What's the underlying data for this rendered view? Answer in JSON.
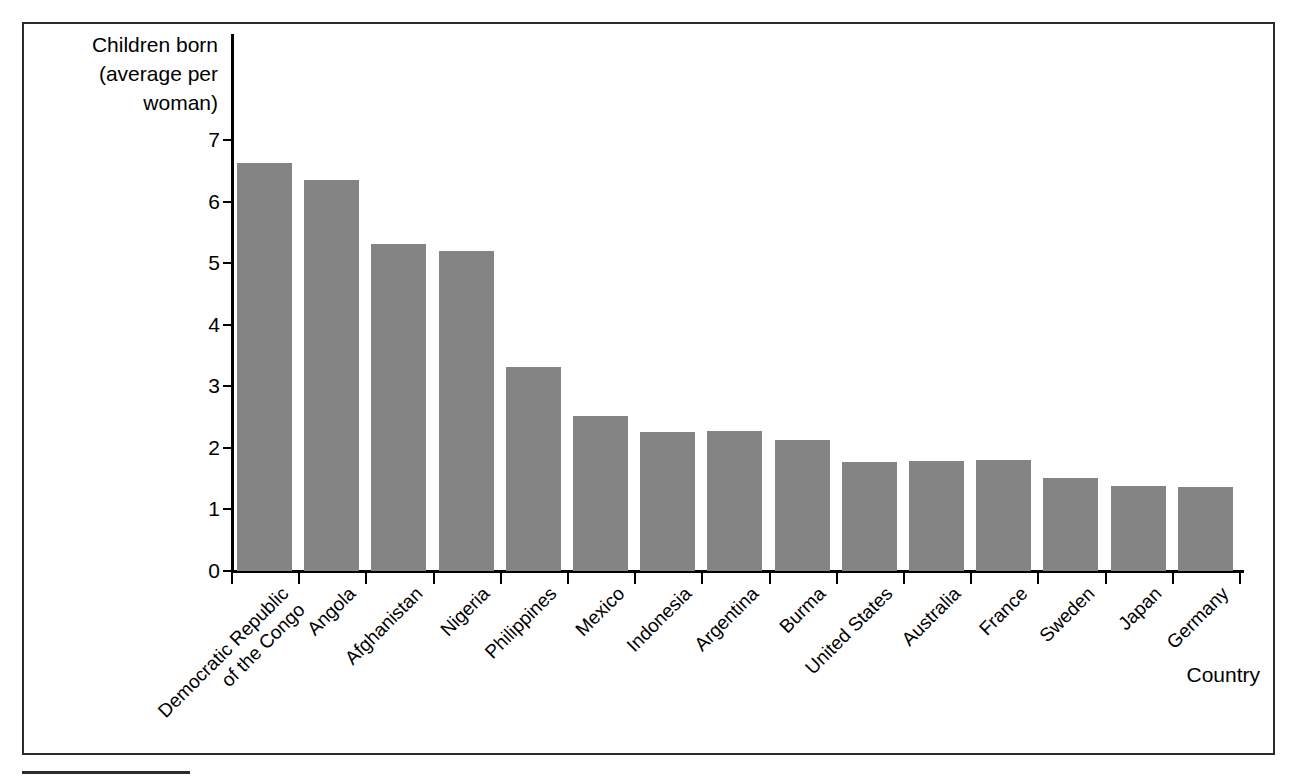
{
  "figure": {
    "y_axis_title": "Children born\n(average per\nwoman)",
    "x_axis_title": "Country"
  },
  "chart_data": {
    "type": "bar",
    "title": "",
    "subtitle": "",
    "xlabel": "Country",
    "ylabel": "Children born (average per woman)",
    "ylim": [
      0,
      7
    ],
    "yticks": [
      "0",
      "1",
      "2",
      "3",
      "4",
      "5",
      "6",
      "7"
    ],
    "grid": false,
    "legend": false,
    "bar_color": "#848484",
    "axis_color": "#000000",
    "categories": [
      "Democratic Republic\nof the Congo",
      "Angola",
      "Afghanistan",
      "Nigeria",
      "Philippines",
      "Mexico",
      "Indonesia",
      "Argentina",
      "Burma",
      "United States",
      "Australia",
      "France",
      "Sweden",
      "Japan",
      "Germany"
    ],
    "values": [
      6.62,
      6.35,
      5.31,
      5.19,
      3.31,
      2.52,
      2.25,
      2.28,
      2.13,
      1.77,
      1.79,
      1.81,
      1.51,
      1.38,
      1.36
    ]
  }
}
